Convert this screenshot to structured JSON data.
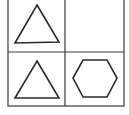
{
  "diagram": {
    "type": "shape-grid-puzzle",
    "rows": 2,
    "cols": 2,
    "line_color": "#3a3a3a",
    "cells": [
      {
        "row": 0,
        "col": 0,
        "shape": "triangle"
      },
      {
        "row": 0,
        "col": 1,
        "shape": "empty"
      },
      {
        "row": 1,
        "col": 0,
        "shape": "triangle"
      },
      {
        "row": 1,
        "col": 1,
        "shape": "hexagon"
      }
    ]
  }
}
